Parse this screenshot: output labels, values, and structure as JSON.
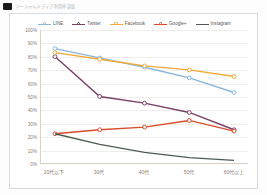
{
  "header": {
    "title": "ソーシャルメディア利用率調査",
    "icon": "app-square-icon"
  },
  "chart_data": {
    "type": "line",
    "title": "",
    "xlabel": "",
    "ylabel": "",
    "categories": [
      "20代以下",
      "30代",
      "40代",
      "50代",
      "60代以上"
    ],
    "ylim": [
      0,
      100
    ],
    "yticks": [
      "0%",
      "10%",
      "20%",
      "30%",
      "40%",
      "50%",
      "60%",
      "70%",
      "80%",
      "90%",
      "100%"
    ],
    "ytick_values": [
      0,
      10,
      20,
      30,
      40,
      50,
      60,
      70,
      80,
      90,
      100
    ],
    "grid": true,
    "legend_position": "top",
    "series": [
      {
        "name": "LINE",
        "color": "#8ab6dc",
        "values": [
          86,
          79,
          72,
          64,
          53
        ]
      },
      {
        "name": "Twitter",
        "color": "#7b3f68",
        "values": [
          80,
          50,
          45,
          38,
          25
        ]
      },
      {
        "name": "Facebook",
        "color": "#f0a83c",
        "values": [
          83,
          78,
          73,
          70,
          65
        ]
      },
      {
        "name": "Google+",
        "color": "#d94a2b",
        "values": [
          22,
          25,
          27,
          32,
          24
        ]
      },
      {
        "name": "Instagram",
        "color": "#4e5b52",
        "values": [
          22,
          14,
          8,
          4,
          2
        ]
      }
    ]
  }
}
